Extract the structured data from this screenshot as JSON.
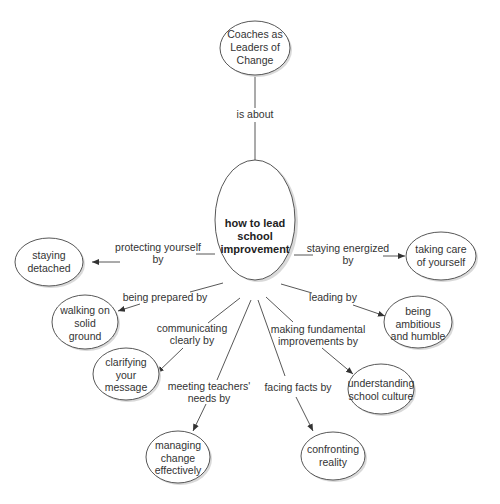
{
  "diagram": {
    "type": "concept-map",
    "root": {
      "lines": [
        "Coaches as",
        "Leaders of",
        "Change"
      ]
    },
    "root_link": {
      "label": "is about"
    },
    "center": {
      "lines": [
        "how to lead",
        "school",
        "improvement"
      ]
    },
    "branches": [
      {
        "link_lines": [
          "protecting yourself",
          "by"
        ],
        "node_lines": [
          "staying",
          "detached"
        ]
      },
      {
        "link_lines": [
          "staying energized",
          "by"
        ],
        "node_lines": [
          "taking care",
          "of yourself"
        ]
      },
      {
        "link_lines": [
          "being prepared by"
        ],
        "node_lines": [
          "walking on",
          "solid",
          "ground"
        ]
      },
      {
        "link_lines": [
          "leading by"
        ],
        "node_lines": [
          "being",
          "ambitious",
          "and humble"
        ]
      },
      {
        "link_lines": [
          "communicating",
          "clearly by"
        ],
        "node_lines": [
          "clarifying",
          "your",
          "message"
        ]
      },
      {
        "link_lines": [
          "making fundamental",
          "improvements by"
        ],
        "node_lines": [
          "understanding",
          "school culture"
        ]
      },
      {
        "link_lines": [
          "meeting teachers'",
          "needs by"
        ],
        "node_lines": [
          "managing",
          "change",
          "effectively"
        ]
      },
      {
        "link_lines": [
          "facing facts by"
        ],
        "node_lines": [
          "confronting",
          "reality"
        ]
      }
    ]
  },
  "colors": {
    "background": "#ffffff",
    "stroke": "#444444",
    "text": "#333333",
    "shadow": "#d9d9d9"
  }
}
